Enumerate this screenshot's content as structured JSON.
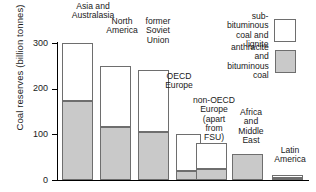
{
  "chart_data": {
    "type": "bar",
    "title": "",
    "xlabel": "",
    "ylabel": "Coal reserves (billion tonnes)",
    "ylim": [
      0,
      320
    ],
    "yticks": [
      0,
      100,
      200,
      300
    ],
    "ytick_labels": [
      "0",
      "100",
      "200",
      "300"
    ],
    "grid": false,
    "stacked": true,
    "legend_position": "top-right",
    "categories": [
      "Asia and\nAustralasia",
      "North\nAmerica",
      "former\nSoviet\nUnion",
      "OECD\nEurope",
      "non-OECD\nEurope\n(apart\nfrom\nFSU)",
      "Africa\nand\nMiddle\nEast",
      "Latin\nAmerica"
    ],
    "series": [
      {
        "name": "anthracite and bituminous coal",
        "color": "#c9c9c9",
        "values": [
          172,
          117,
          105,
          20,
          25,
          57,
          5
        ]
      },
      {
        "name": "sub-bituminous coal and lignite",
        "color": "#ffffff",
        "values": [
          128,
          133,
          135,
          80,
          55,
          0,
          5
        ]
      }
    ],
    "totals": [
      300,
      250,
      240,
      100,
      80,
      57,
      10
    ]
  },
  "legend": {
    "entries": [
      {
        "label": "sub-bituminous\ncoal and lignite",
        "swatch": "light"
      },
      {
        "label": "anthracite and\nbituminous coal",
        "swatch": "dark"
      }
    ]
  }
}
